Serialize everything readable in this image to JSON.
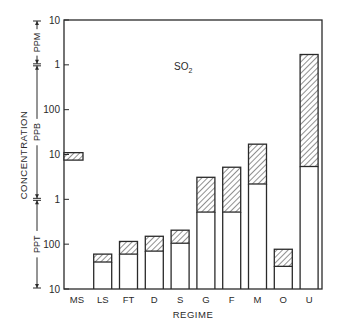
{
  "chart_data": {
    "type": "bar",
    "subtype": "floating-range-bar",
    "title": "",
    "annotation": {
      "text": "SO",
      "subscript": "2"
    },
    "xlabel": "REGIME",
    "ylabel": "CONCENTRATION",
    "yscale": "log",
    "ylim_ppt": [
      10,
      10000000
    ],
    "y_tick_labels": [
      "10",
      "1",
      "100",
      "10",
      "1",
      "100",
      "10"
    ],
    "y_tick_values_ppt": [
      10000000,
      1000000,
      100000,
      10000,
      1000,
      100,
      10
    ],
    "unit_brackets": [
      {
        "label": "PPM",
        "from_ppt": 1000000,
        "to_ppt": 10000000
      },
      {
        "label": "PPB",
        "from_ppt": 1000,
        "to_ppt": 1000000
      },
      {
        "label": "PPT",
        "from_ppt": 10,
        "to_ppt": 1000
      }
    ],
    "categories": [
      "MS",
      "LS",
      "FT",
      "D",
      "S",
      "G",
      "F",
      "M",
      "O",
      "U"
    ],
    "ranges_ppt": [
      {
        "category": "MS",
        "low": 7500,
        "high": 11000,
        "stem": false
      },
      {
        "category": "LS",
        "low": 40,
        "high": 60,
        "stem": true
      },
      {
        "category": "FT",
        "low": 60,
        "high": 115,
        "stem": true
      },
      {
        "category": "D",
        "low": 70,
        "high": 150,
        "stem": true
      },
      {
        "category": "S",
        "low": 105,
        "high": 205,
        "stem": true
      },
      {
        "category": "G",
        "low": 520,
        "high": 3100,
        "stem": true
      },
      {
        "category": "F",
        "low": 520,
        "high": 5200,
        "stem": true
      },
      {
        "category": "M",
        "low": 2200,
        "high": 17000,
        "stem": true
      },
      {
        "category": "O",
        "low": 32,
        "high": 77,
        "stem": true
      },
      {
        "category": "U",
        "low": 5400,
        "high": 1700000,
        "stem": true
      }
    ],
    "grid": false,
    "legend": "none"
  },
  "colors": {
    "ink": "#2a2a2a",
    "hatch": "#555555",
    "background": "#ffffff"
  }
}
